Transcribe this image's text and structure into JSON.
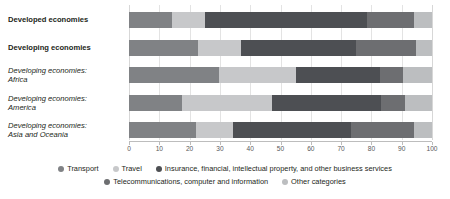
{
  "chart_data": {
    "type": "bar",
    "orientation": "horizontal",
    "stacked": true,
    "title": "",
    "subtitle": "",
    "xlabel": "",
    "ylabel": "",
    "xlim": [
      0,
      100
    ],
    "xticks": [
      0,
      10,
      20,
      30,
      40,
      50,
      60,
      70,
      80,
      90,
      100
    ],
    "xtick_labels": [
      "0",
      "10",
      "20",
      "30",
      "40",
      "50",
      "60",
      "70",
      "80",
      "90",
      "100"
    ],
    "grid": true,
    "legend_position": "bottom",
    "categories": [
      "Developed economies",
      "Developing economies",
      "Developing economies: Africa",
      "Developing economies: America",
      "Developing economies: Asia and Oceania"
    ],
    "series": [
      {
        "name": "Transport",
        "color": "#808285",
        "values": [
          14.1,
          22.8,
          29.7,
          17.6,
          22.0
        ]
      },
      {
        "name": "Travel",
        "color": "#c7c8ca",
        "values": [
          11.0,
          14.3,
          25.3,
          29.5,
          12.4
        ]
      },
      {
        "name": "Insurance, financial, intellectual property, and other business services",
        "color": "#4d4f53",
        "values": [
          53.6,
          37.7,
          27.8,
          36.0,
          38.8
        ]
      },
      {
        "name": "Telecommunications, computer and information",
        "color": "#6d6e71",
        "values": [
          15.4,
          20.0,
          7.6,
          8.0,
          20.9
        ]
      },
      {
        "name": "Other categories",
        "color": "#bcbec0",
        "values": [
          5.9,
          5.2,
          9.6,
          8.9,
          5.9
        ]
      }
    ]
  },
  "categories_display": [
    {
      "lines": [
        "Developed economies"
      ],
      "style": "bold"
    },
    {
      "lines": [
        "Developing economies"
      ],
      "style": "bold"
    },
    {
      "lines": [
        "Developing economies:",
        "Africa"
      ],
      "style": "italic"
    },
    {
      "lines": [
        "Developing economies:",
        "America"
      ],
      "style": "italic"
    },
    {
      "lines": [
        "Developing economies:",
        "Asia and Oceania"
      ],
      "style": "italic"
    }
  ],
  "legend": {
    "row1": [
      {
        "label": "Transport",
        "color": "#808285"
      },
      {
        "label": "Travel",
        "color": "#c7c8ca"
      },
      {
        "label": "Insurance, financial, intellectual property, and other business services",
        "color": "#4d4f53"
      }
    ],
    "row2": [
      {
        "label": "Telecommunications, computer and information",
        "color": "#6d6e71"
      },
      {
        "label": "Other categories",
        "color": "#bcbec0"
      }
    ]
  },
  "colors": {
    "background": "#ffffff",
    "text": "#231f20",
    "axis": "#bdbdbd",
    "grid": "#e3e3e3"
  }
}
